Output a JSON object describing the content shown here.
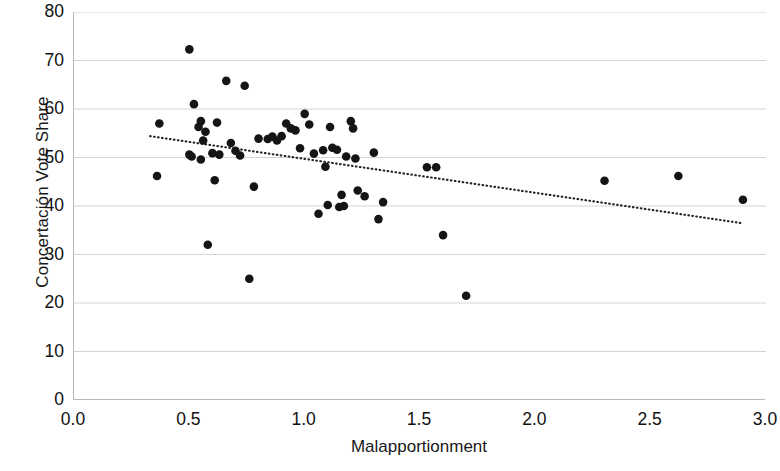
{
  "chart_data": {
    "type": "scatter",
    "title": "",
    "xlabel": "Malapportionment",
    "ylabel": "Concertación Vote Share",
    "xlim": [
      0.0,
      3.0
    ],
    "ylim": [
      0,
      80
    ],
    "xticks": [
      "0.0",
      "0.5",
      "1.0",
      "1.5",
      "2.0",
      "2.5",
      "3.0"
    ],
    "xtick_values": [
      0.0,
      0.5,
      1.0,
      1.5,
      2.0,
      2.5,
      3.0
    ],
    "yticks": [
      "0",
      "10",
      "20",
      "30",
      "40",
      "50",
      "60",
      "70",
      "80"
    ],
    "ytick_values": [
      0,
      10,
      20,
      30,
      40,
      50,
      60,
      70,
      80
    ],
    "grid": "horizontal",
    "grid_color": "#cfcfcf",
    "axis_color": "#b8b8b8",
    "marker_color": "#151515",
    "marker_radius": 4.3,
    "legend": null,
    "series": [
      {
        "name": "Districts",
        "marker": "circle",
        "points": [
          [
            0.37,
            57.0
          ],
          [
            0.36,
            46.2
          ],
          [
            0.5,
            72.3
          ],
          [
            0.5,
            50.6
          ],
          [
            0.51,
            50.2
          ],
          [
            0.52,
            61.0
          ],
          [
            0.54,
            56.3
          ],
          [
            0.55,
            57.5
          ],
          [
            0.55,
            49.6
          ],
          [
            0.56,
            53.5
          ],
          [
            0.57,
            55.3
          ],
          [
            0.58,
            32.0
          ],
          [
            0.6,
            50.9
          ],
          [
            0.61,
            45.3
          ],
          [
            0.62,
            57.2
          ],
          [
            0.63,
            50.6
          ],
          [
            0.66,
            65.8
          ],
          [
            0.68,
            53.0
          ],
          [
            0.7,
            51.4
          ],
          [
            0.72,
            50.4
          ],
          [
            0.74,
            64.8
          ],
          [
            0.76,
            25.0
          ],
          [
            0.78,
            44.0
          ],
          [
            0.8,
            53.9
          ],
          [
            0.84,
            53.8
          ],
          [
            0.86,
            54.3
          ],
          [
            0.88,
            53.5
          ],
          [
            0.9,
            54.4
          ],
          [
            0.92,
            57.0
          ],
          [
            0.94,
            56.0
          ],
          [
            0.96,
            55.6
          ],
          [
            0.98,
            51.9
          ],
          [
            1.0,
            59.0
          ],
          [
            1.02,
            56.8
          ],
          [
            1.04,
            50.8
          ],
          [
            1.06,
            38.4
          ],
          [
            1.08,
            51.5
          ],
          [
            1.09,
            48.1
          ],
          [
            1.1,
            40.2
          ],
          [
            1.11,
            56.3
          ],
          [
            1.12,
            52.0
          ],
          [
            1.14,
            51.6
          ],
          [
            1.15,
            39.8
          ],
          [
            1.16,
            42.3
          ],
          [
            1.17,
            40.0
          ],
          [
            1.18,
            50.2
          ],
          [
            1.2,
            57.5
          ],
          [
            1.21,
            56.0
          ],
          [
            1.22,
            49.8
          ],
          [
            1.23,
            43.2
          ],
          [
            1.26,
            42.0
          ],
          [
            1.3,
            51.0
          ],
          [
            1.32,
            37.3
          ],
          [
            1.34,
            40.8
          ],
          [
            1.53,
            48.0
          ],
          [
            1.57,
            48.0
          ],
          [
            1.6,
            34.0
          ],
          [
            1.7,
            21.5
          ],
          [
            2.3,
            45.2
          ],
          [
            2.62,
            46.2
          ],
          [
            2.9,
            41.3
          ]
        ]
      }
    ],
    "trendline": {
      "style": "dotted",
      "color": "#222222",
      "x_start": 0.33,
      "y_start": 54.4,
      "x_end": 2.89,
      "y_end": 36.5
    }
  },
  "axis": {
    "y_title": "Concertación Vote Share",
    "x_title": "Malapportionment"
  }
}
